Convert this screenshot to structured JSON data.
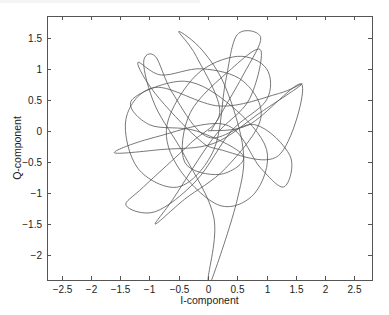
{
  "chart_data": {
    "type": "line",
    "title": "",
    "xlabel": "I-component",
    "ylabel": "Q-component",
    "xlim": [
      -2.75,
      2.8
    ],
    "ylim": [
      -2.4,
      1.85
    ],
    "xticks": [
      -2.5,
      -2,
      -1.5,
      -1,
      -0.5,
      0,
      0.5,
      1,
      1.5,
      2,
      2.5
    ],
    "xtick_labels": [
      "-2.5",
      "-2",
      "-1.5",
      "-1",
      "-0.5",
      "0",
      "0.5",
      "1",
      "1.5",
      "2",
      "2.5"
    ],
    "yticks": [
      -2,
      -1.5,
      -1,
      -0.5,
      0,
      0.5,
      1,
      1.5
    ],
    "ytick_labels": [
      "-2",
      "-1.5",
      "-1",
      "-0.5",
      "0",
      "0.5",
      "1",
      "1.5"
    ],
    "grid": false,
    "legend": null,
    "line_color": "#555555",
    "series": [
      {
        "name": "IQ trajectory",
        "points": [
          [
            0.05,
            0.0
          ],
          [
            0.6,
            0.9
          ],
          [
            0.9,
            1.5
          ],
          [
            0.5,
            1.55
          ],
          [
            0.3,
            0.8
          ],
          [
            0.1,
            -0.3
          ],
          [
            -0.5,
            -0.9
          ],
          [
            -1.2,
            -0.6
          ],
          [
            -1.4,
            0.2
          ],
          [
            -0.9,
            0.7
          ],
          [
            0.2,
            0.4
          ],
          [
            1.2,
            0.6
          ],
          [
            1.6,
            0.75
          ],
          [
            0.9,
            0.3
          ],
          [
            0.1,
            -0.2
          ],
          [
            -0.8,
            -0.3
          ],
          [
            -1.6,
            -0.35
          ],
          [
            -0.9,
            -0.1
          ],
          [
            0.3,
            0.1
          ],
          [
            0.9,
            -0.6
          ],
          [
            1.3,
            -0.9
          ],
          [
            1.4,
            -0.4
          ],
          [
            0.8,
            0.1
          ],
          [
            0.0,
            -0.1
          ],
          [
            -0.6,
            0.6
          ],
          [
            -0.9,
            1.2
          ],
          [
            -1.1,
            1.1
          ],
          [
            -0.9,
            0.4
          ],
          [
            -0.4,
            -0.4
          ],
          [
            0.1,
            -1.4
          ],
          [
            0.0,
            -2.4
          ],
          [
            0.1,
            -2.3
          ],
          [
            0.5,
            -1.1
          ],
          [
            0.6,
            -0.3
          ],
          [
            0.3,
            0.7
          ],
          [
            -0.1,
            1.3
          ],
          [
            -0.5,
            1.6
          ],
          [
            -0.2,
            1.2
          ],
          [
            0.2,
            0.3
          ],
          [
            -0.3,
            -0.2
          ],
          [
            -1.1,
            -0.9
          ],
          [
            -1.4,
            -1.2
          ],
          [
            -0.9,
            -1.3
          ],
          [
            -0.2,
            -0.8
          ],
          [
            0.4,
            0.0
          ],
          [
            1.0,
            0.5
          ],
          [
            1.0,
            1.0
          ],
          [
            0.5,
            1.2
          ],
          [
            -0.2,
            0.9
          ],
          [
            -0.7,
            0.1
          ],
          [
            -0.5,
            -0.6
          ],
          [
            0.2,
            -1.2
          ],
          [
            0.8,
            -1.0
          ],
          [
            1.0,
            -0.3
          ],
          [
            0.4,
            0.4
          ],
          [
            -0.4,
            0.8
          ],
          [
            -1.3,
            0.5
          ],
          [
            -1.0,
            0.1
          ],
          [
            -0.2,
            0.0
          ],
          [
            0.6,
            -0.4
          ],
          [
            0.2,
            -0.7
          ],
          [
            -0.4,
            -0.5
          ],
          [
            -0.3,
            0.3
          ],
          [
            0.4,
            1.0
          ],
          [
            0.9,
            1.3
          ],
          [
            0.7,
            0.5
          ],
          [
            0.1,
            -0.1
          ],
          [
            -0.6,
            -1.1
          ],
          [
            -0.9,
            -1.5
          ],
          [
            -0.4,
            -1.1
          ],
          [
            0.3,
            -0.6
          ],
          [
            0.9,
            0.2
          ],
          [
            0.6,
            0.8
          ],
          [
            -0.1,
            1.0
          ],
          [
            -0.8,
            0.9
          ],
          [
            -1.2,
            1.1
          ],
          [
            -0.9,
            0.6
          ],
          [
            -0.2,
            -0.1
          ],
          [
            0.2,
            -0.3
          ],
          [
            1.2,
            -0.4
          ],
          [
            1.6,
            0.75
          ],
          [
            0.7,
            0.1
          ],
          [
            0.0,
            0.0
          ]
        ]
      }
    ]
  },
  "plot": {
    "box": {
      "left": 47,
      "top": 16,
      "right": 372,
      "bottom": 280
    }
  }
}
